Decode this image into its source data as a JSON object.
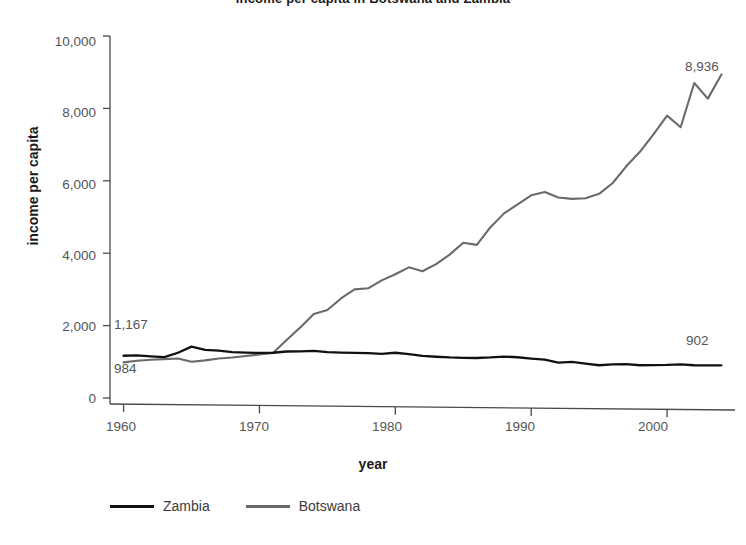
{
  "chart_data": {
    "type": "line",
    "title": "Income per capita in Botswana and Zambia",
    "xlabel": "year",
    "ylabel": "income per capita",
    "xlim": [
      1959,
      2005
    ],
    "ylim": [
      0,
      10000
    ],
    "grid": false,
    "legend_position": "bottom-left",
    "x_ticks": [
      "1960",
      "1970",
      "1980",
      "1990",
      "2000"
    ],
    "x_tick_values": [
      1960,
      1970,
      1980,
      1990,
      2000
    ],
    "y_ticks": [
      "0",
      "2,000",
      "4,000",
      "6,000",
      "8,000",
      "10,000"
    ],
    "y_tick_values": [
      0,
      2000,
      4000,
      6000,
      8000,
      10000
    ],
    "x": [
      1960,
      1961,
      1962,
      1963,
      1964,
      1965,
      1966,
      1967,
      1968,
      1969,
      1970,
      1971,
      1972,
      1973,
      1974,
      1975,
      1976,
      1977,
      1978,
      1979,
      1980,
      1981,
      1982,
      1983,
      1984,
      1985,
      1986,
      1987,
      1988,
      1989,
      1990,
      1991,
      1992,
      1993,
      1994,
      1995,
      1996,
      1997,
      1998,
      1999,
      2000,
      2001,
      2002,
      2003,
      2004
    ],
    "series": [
      {
        "name": "Zambia",
        "color": "#111111",
        "values": [
          1167,
          1175,
          1150,
          1130,
          1250,
          1420,
          1330,
          1310,
          1270,
          1255,
          1245,
          1250,
          1285,
          1290,
          1300,
          1270,
          1255,
          1245,
          1240,
          1220,
          1250,
          1210,
          1165,
          1140,
          1120,
          1110,
          1105,
          1120,
          1145,
          1125,
          1090,
          1060,
          975,
          1000,
          950,
          905,
          930,
          935,
          905,
          910,
          915,
          930,
          905,
          900,
          902
        ]
      },
      {
        "name": "Botswana",
        "color": "#6a6a6a",
        "values": [
          984,
          1030,
          1055,
          1075,
          1090,
          1000,
          1040,
          1090,
          1120,
          1160,
          1200,
          1245,
          1600,
          1950,
          2320,
          2430,
          2750,
          3000,
          3030,
          3250,
          3420,
          3610,
          3500,
          3700,
          3960,
          4290,
          4230,
          4720,
          5100,
          5350,
          5600,
          5690,
          5540,
          5500,
          5520,
          5640,
          5940,
          6400,
          6800,
          7280,
          7800,
          7480,
          8700,
          8270,
          8936
        ]
      }
    ],
    "annotations": [
      {
        "text": "1,167",
        "series": "Zambia",
        "at": "start",
        "x": 1960,
        "value": 1167
      },
      {
        "text": "984",
        "series": "Botswana",
        "at": "start",
        "x": 1960,
        "value": 984
      },
      {
        "text": "8,936",
        "series": "Botswana",
        "at": "end",
        "x": 2004,
        "value": 8936
      },
      {
        "text": "902",
        "series": "Zambia",
        "at": "end",
        "x": 2004,
        "value": 902
      }
    ]
  },
  "axes": {
    "y_label": "income per capita",
    "x_label": "year",
    "y_tick_0": "0",
    "y_tick_1": "2,000",
    "y_tick_2": "4,000",
    "y_tick_3": "6,000",
    "y_tick_4": "8,000",
    "y_tick_5": "10,000",
    "x_tick_0": "1960",
    "x_tick_1": "1970",
    "x_tick_2": "1980",
    "x_tick_3": "1990",
    "x_tick_4": "2000"
  },
  "annotations": {
    "zambia_start": "1,167",
    "botswana_start": "984",
    "botswana_end": "8,936",
    "zambia_end": "902"
  },
  "legend": {
    "zambia": "Zambia",
    "botswana": "Botswana"
  },
  "header": {
    "title": "Income per capita in Botswana and Zambia"
  },
  "colors": {
    "zambia": "#111111",
    "botswana": "#6a6a6a",
    "axis": "#4a4a4a",
    "background": "#ffffff"
  }
}
